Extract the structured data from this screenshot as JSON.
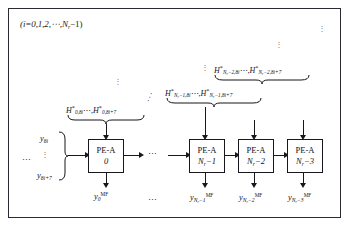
{
  "figure": {
    "index_note": "(i=0,1,2,⋯,N",
    "index_note_sub": "r",
    "index_note_tail": "−1)"
  },
  "pe_units": [
    {
      "name": "PE-A",
      "index_main": "0",
      "index_sub": "",
      "index_tail": ""
    },
    {
      "name": "PE-A",
      "index_main": "N",
      "index_sub": "r",
      "index_tail": "−1"
    },
    {
      "name": "PE-A",
      "index_main": "N",
      "index_sub": "r",
      "index_tail": "−2"
    },
    {
      "name": "PE-A",
      "index_main": "N",
      "index_sub": "r",
      "index_tail": "−3"
    }
  ],
  "coefficient_labels": [
    {
      "left_head": "H",
      "left_star": "*",
      "left_sub": "0,8i",
      "mid": "⋯",
      "right_head": "H",
      "right_star": "*",
      "right_sub": "0,8i+7"
    },
    {
      "left_head": "H",
      "left_star": "*",
      "left_sub": "N",
      "left_sub2": "r",
      "left_sub3": "−1,8i",
      "mid": "⋯",
      "right_head": "H",
      "right_star": "*",
      "right_sub": "N",
      "right_sub2": "r",
      "right_sub3": "−1,8i+7"
    },
    {
      "left_head": "H",
      "left_star": "*",
      "left_sub": "N",
      "left_sub2": "r",
      "left_sub3": "−2,8i",
      "mid": "⋯",
      "right_head": "H",
      "right_star": "*",
      "right_sub": "N",
      "right_sub2": "r",
      "right_sub3": "−2,8i+7"
    }
  ],
  "inputs": {
    "top": {
      "head": "y",
      "sub": "8i"
    },
    "bottom": {
      "head": "y",
      "sub": "8i+7"
    },
    "vertical_dots": "⋮",
    "left_dots": "⋯"
  },
  "outputs": [
    {
      "head": "y",
      "sub_main": "0",
      "sub_tail": "",
      "sup": "MF"
    },
    {
      "head": "y",
      "sub_main": "N",
      "sub_mid": "r",
      "sub_tail": "−1",
      "sup": "MF"
    },
    {
      "head": "y",
      "sub_main": "N",
      "sub_mid": "r",
      "sub_tail": "−2",
      "sup": "MF"
    },
    {
      "head": "y",
      "sub_main": "N",
      "sub_mid": "r",
      "sub_tail": "−3",
      "sup": "MF"
    }
  ],
  "ellipses": {
    "chain_middle": "⋯",
    "output_row": "⋯",
    "diagonal": "⋰",
    "vertical_top_right": "⋮",
    "vertical_mid_right": "⋮",
    "vertical_over_first": "⋮",
    "vertical_before_top_coeff": "⋮"
  },
  "colors": {
    "stroke": "#17171d",
    "frame": "#2a2a35",
    "text": "#15151b",
    "dots": "#3a3a44",
    "background": "#ffffff"
  }
}
